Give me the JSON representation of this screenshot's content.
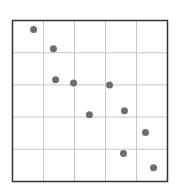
{
  "chart_data": {
    "type": "scatter",
    "title": "",
    "xlabel": "",
    "ylabel": "",
    "grid": true,
    "grid_divisions": {
      "x": 5,
      "y": 5
    },
    "xlim": [
      0,
      5
    ],
    "ylim": [
      0,
      5
    ],
    "legend": null,
    "point_color": "#6e6e6e",
    "grid_color": "#c8c8c8",
    "frame_color": "#333333",
    "series": [
      {
        "name": "points",
        "points": [
          {
            "x": 0.68,
            "y": 4.72
          },
          {
            "x": 1.32,
            "y": 4.12
          },
          {
            "x": 1.39,
            "y": 3.16
          },
          {
            "x": 1.97,
            "y": 3.06
          },
          {
            "x": 3.13,
            "y": 3.0
          },
          {
            "x": 2.48,
            "y": 2.07
          },
          {
            "x": 3.61,
            "y": 2.2
          },
          {
            "x": 4.29,
            "y": 1.52
          },
          {
            "x": 3.58,
            "y": 0.87
          },
          {
            "x": 4.55,
            "y": 0.43
          }
        ]
      }
    ]
  }
}
